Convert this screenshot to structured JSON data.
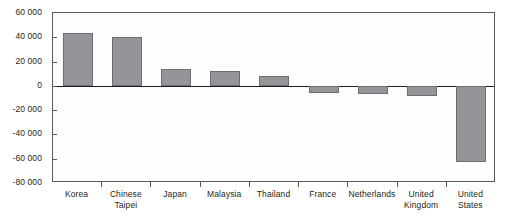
{
  "chart_data": {
    "type": "bar",
    "title": "",
    "subtitle": "",
    "xlabel": "",
    "ylabel": "",
    "ylim": [
      -80000,
      60000
    ],
    "ytick_step": 20000,
    "grid": false,
    "legend": "none",
    "bar_color": "#949599",
    "bar_border_color": "#6d6e71",
    "axis_color": "#58595b",
    "zero_line_color": "#231f20",
    "categories": [
      "Korea",
      "Chinese Taipei",
      "Japan",
      "Malaysia",
      "Thailand",
      "France",
      "Netherlands",
      "United Kingdom",
      "United States"
    ],
    "category_lines": [
      [
        "Korea"
      ],
      [
        "Chinese",
        "Taipei"
      ],
      [
        "Japan"
      ],
      [
        "Malaysia"
      ],
      [
        "Thailand"
      ],
      [
        "France"
      ],
      [
        "Netherlands"
      ],
      [
        "United",
        "Kingdom"
      ],
      [
        "United",
        "States"
      ]
    ],
    "values": [
      43500,
      40500,
      14000,
      12500,
      8500,
      -5500,
      -6500,
      -8000,
      -63000
    ],
    "ytick_labels": [
      "60 000",
      "40 000",
      "20 000",
      "0",
      "-20 000",
      "-40 000",
      "-60 000",
      "-80 000"
    ],
    "ytick_values": [
      60000,
      40000,
      20000,
      0,
      -20000,
      -40000,
      -60000,
      -80000
    ]
  }
}
